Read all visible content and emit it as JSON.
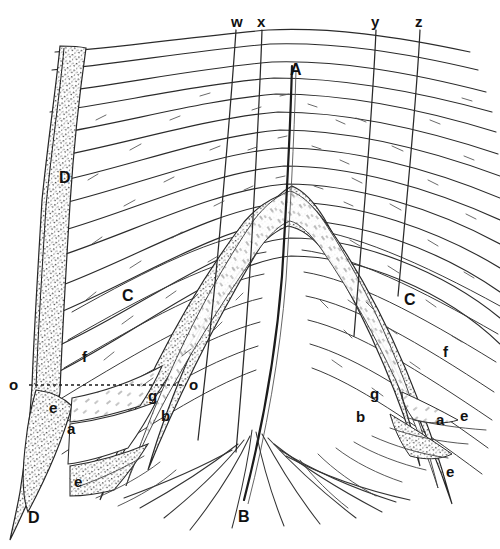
{
  "figure": {
    "background_color": "#ffffff",
    "ink_color": "#1a1a1a",
    "stipple_color": "#3a3a3a",
    "width": 500,
    "height": 549
  },
  "labels": {
    "top_fault_traces": [
      {
        "id": "w",
        "text": "w",
        "x": 231,
        "y": 14
      },
      {
        "id": "x",
        "text": "x",
        "x": 257,
        "y": 14
      },
      {
        "id": "y",
        "text": "y",
        "x": 371,
        "y": 14
      },
      {
        "id": "z",
        "text": "z",
        "x": 415,
        "y": 14
      }
    ],
    "axial_points": [
      {
        "id": "A",
        "text": "A",
        "x": 290,
        "y": 62
      },
      {
        "id": "B",
        "text": "B",
        "x": 238,
        "y": 509
      }
    ],
    "reference_line_ends": [
      {
        "id": "o-left",
        "text": "o",
        "x": 9,
        "y": 377
      },
      {
        "id": "o-right",
        "text": "o",
        "x": 189,
        "y": 377
      }
    ],
    "beds_left": [
      {
        "id": "D-upper-left",
        "text": "D",
        "x": 59,
        "y": 170
      },
      {
        "id": "C-left",
        "text": "C",
        "x": 122,
        "y": 288
      },
      {
        "id": "f-left",
        "text": "f",
        "x": 82,
        "y": 349
      },
      {
        "id": "e-left",
        "text": "e",
        "x": 49,
        "y": 400
      },
      {
        "id": "a-left",
        "text": "a",
        "x": 67,
        "y": 421
      },
      {
        "id": "e-lower-left",
        "text": "e",
        "x": 74,
        "y": 474
      },
      {
        "id": "D-lower-left",
        "text": "D",
        "x": 28,
        "y": 510
      },
      {
        "id": "g-center-left",
        "text": "g",
        "x": 148,
        "y": 388
      },
      {
        "id": "b-center-left",
        "text": "b",
        "x": 161,
        "y": 408
      }
    ],
    "beds_right": [
      {
        "id": "C-right",
        "text": "C",
        "x": 404,
        "y": 292
      },
      {
        "id": "f-right",
        "text": "f",
        "x": 443,
        "y": 344
      },
      {
        "id": "g-right",
        "text": "g",
        "x": 370,
        "y": 386
      },
      {
        "id": "b-right",
        "text": "b",
        "x": 356,
        "y": 409
      },
      {
        "id": "a-right",
        "text": "a",
        "x": 436,
        "y": 412
      },
      {
        "id": "e-right",
        "text": "e",
        "x": 460,
        "y": 408
      },
      {
        "id": "e-lower-right",
        "text": "e",
        "x": 446,
        "y": 464
      }
    ]
  },
  "reference_line": {
    "name": "o-o datum line",
    "style": "dotted",
    "x1": 29,
    "y1": 385,
    "x2": 186,
    "y2": 385
  }
}
